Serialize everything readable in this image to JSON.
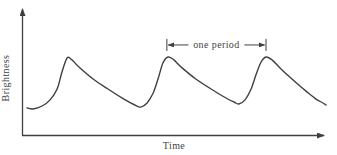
{
  "figure_name": "brightness-vs-time-light-curve",
  "colors": {
    "ink": "#3f3f3f",
    "background": "#ffffff"
  },
  "chart_data": {
    "type": "line",
    "title": "",
    "xlabel": "Time",
    "ylabel": "Brightness",
    "grid": false,
    "legend": null,
    "x_axis": {
      "tick_labels": [],
      "arrow": true,
      "range_normalized": [
        0,
        1
      ]
    },
    "y_axis": {
      "tick_labels": [],
      "arrow": true,
      "range_normalized": [
        0,
        1
      ]
    },
    "series": [
      {
        "name": "brightness",
        "points_normalized": [
          [
            0.016,
            0.213
          ],
          [
            0.036,
            0.205
          ],
          [
            0.066,
            0.228
          ],
          [
            0.092,
            0.276
          ],
          [
            0.115,
            0.362
          ],
          [
            0.131,
            0.496
          ],
          [
            0.148,
            0.606
          ],
          [
            0.164,
            0.591
          ],
          [
            0.187,
            0.535
          ],
          [
            0.233,
            0.441
          ],
          [
            0.282,
            0.362
          ],
          [
            0.334,
            0.283
          ],
          [
            0.37,
            0.236
          ],
          [
            0.39,
            0.22
          ],
          [
            0.41,
            0.252
          ],
          [
            0.43,
            0.331
          ],
          [
            0.446,
            0.441
          ],
          [
            0.462,
            0.567
          ],
          [
            0.479,
            0.614
          ],
          [
            0.498,
            0.591
          ],
          [
            0.525,
            0.528
          ],
          [
            0.57,
            0.441
          ],
          [
            0.62,
            0.362
          ],
          [
            0.669,
            0.291
          ],
          [
            0.695,
            0.26
          ],
          [
            0.711,
            0.244
          ],
          [
            0.731,
            0.276
          ],
          [
            0.751,
            0.362
          ],
          [
            0.767,
            0.472
          ],
          [
            0.784,
            0.575
          ],
          [
            0.8,
            0.614
          ],
          [
            0.82,
            0.591
          ],
          [
            0.846,
            0.528
          ],
          [
            0.889,
            0.433
          ],
          [
            0.931,
            0.346
          ],
          [
            0.964,
            0.283
          ],
          [
            0.987,
            0.252
          ],
          [
            0.997,
            0.236
          ]
        ]
      }
    ],
    "annotations": [
      {
        "type": "span",
        "label": "one period",
        "x1": 0.475,
        "x2": 0.8,
        "y": 0.709
      }
    ]
  }
}
